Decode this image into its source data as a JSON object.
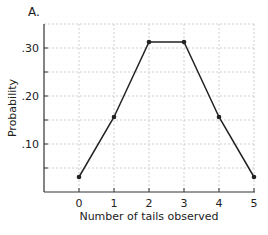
{
  "panel_label": "A.",
  "chart_data": {
    "type": "line",
    "title": "",
    "xlabel": "Number of tails observed",
    "ylabel": "Probability",
    "x": [
      0,
      1,
      2,
      3,
      4,
      5
    ],
    "series": [
      {
        "name": "Probability",
        "values": [
          0.03125,
          0.15625,
          0.3125,
          0.3125,
          0.15625,
          0.03125
        ]
      }
    ],
    "xticks": [
      "0",
      "1",
      "2",
      "3",
      "4",
      "5"
    ],
    "yticks": [
      ".10",
      ".20",
      ".30"
    ],
    "ytick_values": [
      0.1,
      0.2,
      0.3
    ],
    "xlim": [
      -1,
      5
    ],
    "ylim": [
      0,
      0.35
    ],
    "grid": true,
    "grid_style": "dashed",
    "legend": "none",
    "line_color": "#222222",
    "marker": "circle"
  }
}
